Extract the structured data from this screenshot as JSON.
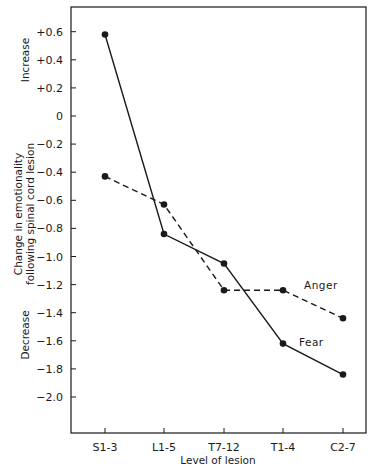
{
  "chart_data": {
    "type": "line",
    "title": "",
    "xlabel": "Level of lesion",
    "ylabel": "Change in emotionality following spinal cord lesion",
    "ylabel_lines": [
      "Change in emotionality",
      "following spinal cord lesion"
    ],
    "y_region_labels": {
      "upper": "Increase",
      "lower": "Decrease"
    },
    "categories": [
      "S1-3",
      "L1-5",
      "T7-12",
      "T1-4",
      "C2-7"
    ],
    "series": [
      {
        "name": "Fear",
        "style": "solid",
        "values": [
          0.58,
          -0.84,
          -1.05,
          -1.62,
          -1.84
        ]
      },
      {
        "name": "Anger",
        "style": "dashed",
        "values": [
          -0.43,
          -0.63,
          -1.24,
          -1.24,
          -1.44
        ]
      }
    ],
    "ylim": [
      -2.2,
      0.75
    ],
    "yticks": [
      0.6,
      0.4,
      0.2,
      0,
      -0.2,
      -0.4,
      -0.6,
      -0.8,
      -1.0,
      -1.2,
      -1.4,
      -1.6,
      -1.8,
      -2.0
    ],
    "ytick_labels": [
      "+0.6",
      "+0.4",
      "+0.2",
      "0",
      "−0.2",
      "−0.4",
      "−0.6",
      "−0.8",
      "−1.0",
      "−1.2",
      "−1.4",
      "−1.6",
      "−1.8",
      "−2.0"
    ],
    "grid": false,
    "legend": "inline labels near series",
    "line_color": "#1a1a1a"
  }
}
